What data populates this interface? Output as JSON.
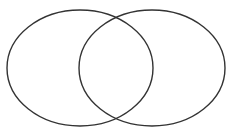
{
  "diagram": {
    "type": "venn",
    "set_count": 2,
    "background": "#ffffff",
    "stroke_color": "#333333",
    "sets": [
      {
        "id": "left",
        "label": "",
        "cx": 80,
        "cy": 68,
        "rx": 73,
        "ry": 58
      },
      {
        "id": "right",
        "label": "",
        "cx": 152,
        "cy": 68,
        "rx": 73,
        "ry": 58
      }
    ]
  }
}
